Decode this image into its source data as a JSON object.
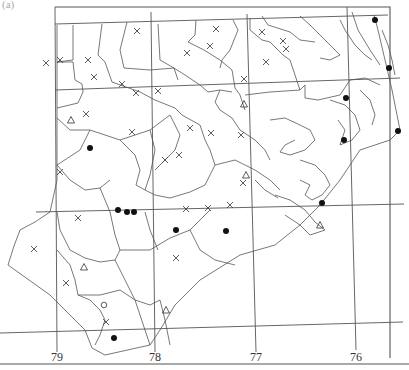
{
  "panel_label": "(a)",
  "map": {
    "title": "",
    "region": "North Carolina (eastern/southern portion)",
    "longitude_labels": [
      "79",
      "78",
      "77",
      "76"
    ],
    "marker_types": {
      "filled-circle": "●",
      "cross": "×",
      "triangle": "△",
      "open-circle": "○"
    },
    "colors": {
      "line": "#555555",
      "marker": "#111111",
      "background": "#ffffff"
    }
  },
  "chart_data": {
    "type": "scatter",
    "title": "",
    "xlabel": "",
    "ylabel": "",
    "x_ticks": [
      "79",
      "78",
      "77",
      "76"
    ],
    "series": [
      {
        "name": "filled-circle",
        "count": 13
      },
      {
        "name": "cross",
        "count": 33
      },
      {
        "name": "triangle",
        "count": 6
      },
      {
        "name": "open-circle",
        "count": 1
      }
    ]
  }
}
